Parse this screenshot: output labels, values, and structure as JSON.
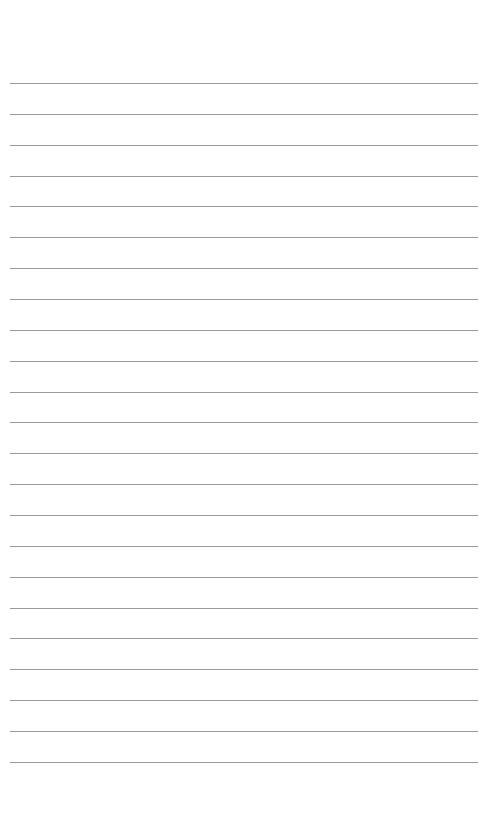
{
  "page": {
    "type": "lined-paper",
    "background_color": "#ffffff",
    "line_color": "#9a9a9a",
    "line_count": 23,
    "first_line_y": 83,
    "line_spacing": 30.86,
    "line_left": 10,
    "line_width": 468
  }
}
